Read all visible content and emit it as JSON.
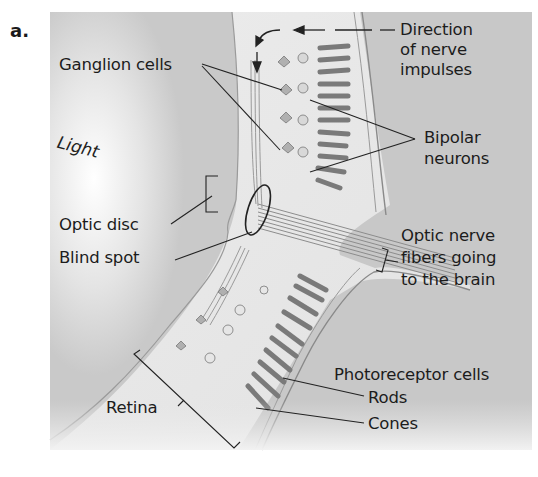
{
  "figure": {
    "panel_letter": "a.",
    "colors": {
      "panel_background": "#c9c9c9",
      "retina_tissue": "#e8e8e8",
      "outline": "#8a8a8a",
      "cell_gray": "#7a7a7a",
      "text": "#1c1c1c"
    }
  },
  "labels": {
    "light": "Light",
    "ganglion_cells": "Ganglion cells",
    "direction_line1": "Direction",
    "direction_line2": "of nerve",
    "direction_line3": "impulses",
    "bipolar_line1": "Bipolar",
    "bipolar_line2": "neurons",
    "optic_disc": "Optic disc",
    "blind_spot": "Blind spot",
    "optic_nerve_line1": "Optic nerve",
    "optic_nerve_line2": "fibers going",
    "optic_nerve_line3": "to the brain",
    "photoreceptor_cells": "Photoreceptor cells",
    "rods": "Rods",
    "cones": "Cones",
    "retina": "Retina"
  }
}
